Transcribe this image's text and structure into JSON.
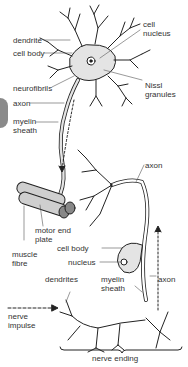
{
  "diagram": {
    "labels": {
      "dendrite": "dendrite",
      "cell_nucleus_1": "cell",
      "cell_nucleus_2": "nucleus",
      "cell_body_top": "cell body",
      "neurofibrils": "neurofibrils",
      "nissl_1": "Nissl",
      "nissl_2": "granules",
      "axon_top": "axon",
      "myelin_top_1": "myelin",
      "myelin_top_2": "sheath",
      "axon_right": "axon",
      "motor_end_1": "motor end",
      "motor_end_2": "plate",
      "muscle_1": "muscle",
      "muscle_2": "fibre",
      "cell_body_bottom": "cell body",
      "nucleus_bottom": "nucleus",
      "dendrites": "dendrites",
      "myelin_bottom_1": "myelin",
      "myelin_bottom_2": "sheath",
      "axon_bottom": "axon",
      "nerve_impulse_1": "nerve",
      "nerve_impulse_2": "impulse",
      "nerve_ending": "nerve ending"
    },
    "colors": {
      "line": "#222222",
      "fill": "#e4e4e4",
      "label": "#333333",
      "edge_tab": "#8a8a8a"
    }
  }
}
